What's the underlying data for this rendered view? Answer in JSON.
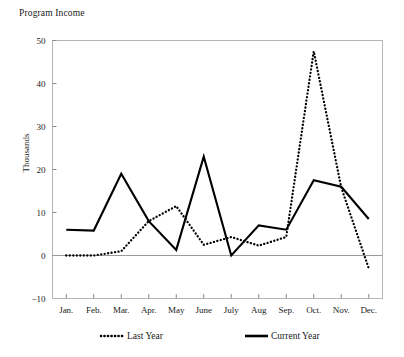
{
  "chart_data": {
    "type": "line",
    "title": "Program Income",
    "xlabel": "",
    "ylabel": "Thousands",
    "categories": [
      "Jan.",
      "Feb.",
      "Mar.",
      "Apr.",
      "May",
      "June",
      "July",
      "Aug",
      "Sep.",
      "Oct.",
      "Nov.",
      "Dec."
    ],
    "ylim": [
      -10,
      50
    ],
    "yticks": [
      50,
      40,
      30,
      20,
      10,
      0,
      -10
    ],
    "ytick_labels": [
      "50",
      "40",
      "30",
      "20",
      "10",
      "0",
      "−10"
    ],
    "grid": false,
    "legend_position": "bottom",
    "series": [
      {
        "name": "Last Year",
        "style": "dotted",
        "color": "#000000",
        "values": [
          0,
          0,
          1,
          8,
          11.5,
          2.5,
          4.3,
          2.3,
          4.3,
          47.5,
          15.8,
          -3
        ]
      },
      {
        "name": "Current Year",
        "style": "solid",
        "color": "#000000",
        "values": [
          6,
          5.8,
          19,
          8,
          1.3,
          23,
          0,
          7,
          6,
          17.5,
          16,
          8.5
        ]
      }
    ]
  },
  "legend": {
    "items": [
      {
        "label": "Last Year",
        "style": "dotted"
      },
      {
        "label": "Current Year",
        "style": "solid"
      }
    ]
  },
  "colors": {
    "axis": "#9a9a9a",
    "series": "#000000",
    "background": "#ffffff",
    "text": "#1a1a1a"
  }
}
